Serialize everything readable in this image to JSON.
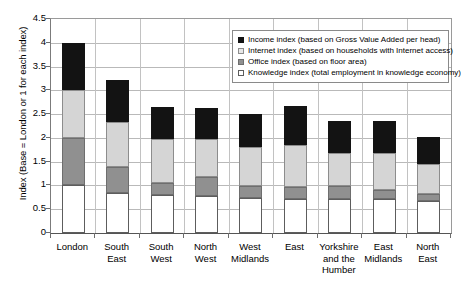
{
  "chart_data": {
    "type": "bar",
    "subtype": "stacked-bar",
    "title": "",
    "xlabel": "",
    "ylabel": "Index (Base = London or 1 for each index)",
    "ylim": [
      0,
      4.5
    ],
    "ytick_step": 0.5,
    "yticks": [
      "0",
      "0.5",
      "1",
      "1.5",
      "2",
      "2.5",
      "3",
      "3.5",
      "4",
      "4.5"
    ],
    "grid": true,
    "legend_position": "top-right",
    "categories": [
      "London",
      "South East",
      "South West",
      "North West",
      "West Midlands",
      "East",
      "Yorkshire and the Humber",
      "East Midlands",
      "North East"
    ],
    "category_lines": [
      [
        "London"
      ],
      [
        "South",
        "East"
      ],
      [
        "South",
        "West"
      ],
      [
        "North",
        "West"
      ],
      [
        "West",
        "Midlands"
      ],
      [
        "East"
      ],
      [
        "Yorkshire",
        "and the",
        "Humber"
      ],
      [
        "East",
        "Midlands"
      ],
      [
        "North",
        "East"
      ]
    ],
    "series": [
      {
        "name": "Knowledge index (total employment in knowledge economy)",
        "short_name": "Knowledge index",
        "color": "#ffffff",
        "values": [
          1.0,
          0.85,
          0.8,
          0.78,
          0.73,
          0.71,
          0.72,
          0.72,
          0.68
        ]
      },
      {
        "name": "Office index (based on floor area)",
        "short_name": "Office index",
        "color": "#909090",
        "values": [
          1.0,
          0.54,
          0.25,
          0.39,
          0.26,
          0.26,
          0.26,
          0.19,
          0.14
        ]
      },
      {
        "name": "Internet index (based on households with Internet access)",
        "short_name": "Internet index",
        "color": "#d5d5d5",
        "values": [
          1.0,
          0.94,
          0.92,
          0.8,
          0.82,
          0.89,
          0.71,
          0.77,
          0.63
        ]
      },
      {
        "name": "Income index (based on Gross Value Added per head)",
        "short_name": "Income index",
        "color": "#131313",
        "values": [
          1.0,
          0.89,
          0.68,
          0.66,
          0.7,
          0.81,
          0.66,
          0.68,
          0.56
        ]
      }
    ],
    "cumulative_tops": [
      {
        "category": "London",
        "knowledge": 1.0,
        "office": 2.0,
        "internet": 3.0,
        "income": 4.0
      },
      {
        "category": "South East",
        "knowledge": 0.85,
        "office": 1.39,
        "internet": 2.33,
        "income": 3.22
      },
      {
        "category": "South West",
        "knowledge": 0.8,
        "office": 1.05,
        "internet": 1.97,
        "income": 2.65
      },
      {
        "category": "North West",
        "knowledge": 0.78,
        "office": 1.17,
        "internet": 1.97,
        "income": 2.63
      },
      {
        "category": "West Midlands",
        "knowledge": 0.73,
        "office": 0.99,
        "internet": 1.81,
        "income": 2.51
      },
      {
        "category": "East",
        "knowledge": 0.71,
        "office": 0.97,
        "internet": 1.86,
        "income": 2.67
      },
      {
        "category": "Yorkshire and the Humber",
        "knowledge": 0.72,
        "office": 0.98,
        "internet": 1.69,
        "income": 2.35
      },
      {
        "category": "East Midlands",
        "knowledge": 0.72,
        "office": 0.91,
        "internet": 1.68,
        "income": 2.36
      },
      {
        "category": "North East",
        "knowledge": 0.68,
        "office": 0.82,
        "internet": 1.45,
        "income": 2.01
      }
    ]
  },
  "legend": {
    "items": [
      {
        "label": "Income index (based on Gross Value Added per head)",
        "swatch": "income"
      },
      {
        "label": "Internet index (based on households with Internet access)",
        "swatch": "internet"
      },
      {
        "label": "Office index (based on floor area)",
        "swatch": "office"
      },
      {
        "label": "Knowledge index (total employment in knowledge economy)",
        "swatch": "knowledge"
      }
    ]
  }
}
